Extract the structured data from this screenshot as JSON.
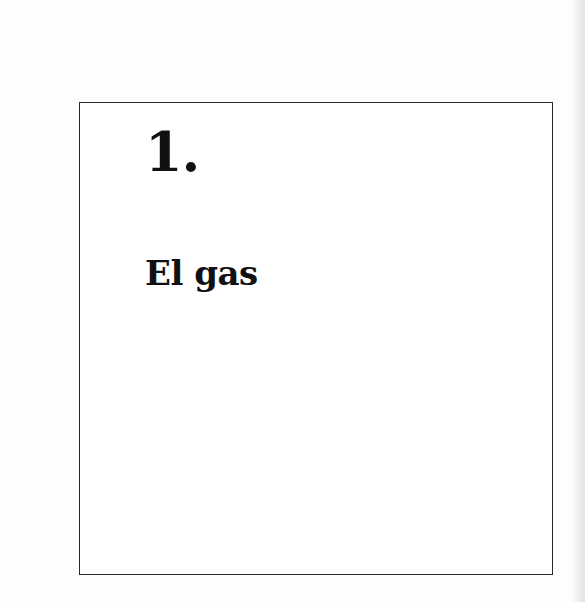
{
  "chapter": {
    "number": "1.",
    "title": "El gas"
  }
}
